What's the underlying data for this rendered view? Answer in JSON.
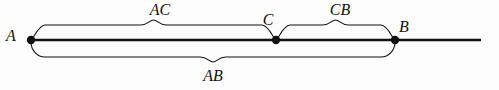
{
  "figure": {
    "type": "number-line-segment-diagram",
    "background_color": "#fdfdfd",
    "stroke_color": "#111111",
    "line": {
      "x_start": 31,
      "x_end": 481,
      "y": 40,
      "thickness": 2.6
    },
    "points": [
      {
        "id": "A",
        "label": "A",
        "x": 31,
        "y": 40,
        "label_x": 11,
        "label_y": 41,
        "radius": 4.2
      },
      {
        "id": "C",
        "label": "C",
        "x": 276,
        "y": 40,
        "label_x": 268,
        "label_y": 25,
        "radius": 4.2
      },
      {
        "id": "B",
        "label": "B",
        "x": 395,
        "y": 40,
        "label_x": 404,
        "label_y": 32,
        "radius": 4.2
      }
    ],
    "braces": [
      {
        "id": "AC",
        "label": "AC",
        "side": "top",
        "x_left": 31,
        "x_right": 276,
        "base_y": 38,
        "span_y": 25,
        "tip_y": 20,
        "label_x": 160,
        "label_y": 15
      },
      {
        "id": "CB",
        "label": "CB",
        "side": "top",
        "x_left": 276,
        "x_right": 395,
        "base_y": 38,
        "span_y": 25,
        "tip_y": 20,
        "label_x": 340,
        "label_y": 15
      },
      {
        "id": "AB",
        "label": "AB",
        "side": "bottom",
        "x_left": 31,
        "x_right": 395,
        "base_y": 42,
        "span_y": 57,
        "tip_y": 62,
        "label_x": 213,
        "label_y": 81
      }
    ]
  }
}
